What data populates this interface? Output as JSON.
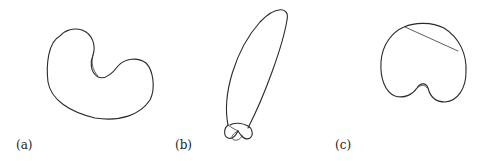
{
  "figure": {
    "panels": [
      {
        "id": "a",
        "label": "(a)",
        "shape": "kidney-shaped closed curve"
      },
      {
        "id": "b",
        "label": "(b)",
        "shape": "elongated ellipse with small overlapping loops at base"
      },
      {
        "id": "c",
        "label": "(c)",
        "shape": "rounded closed curve with chord across top and small notch at bottom"
      }
    ]
  },
  "colors": {
    "stroke": "#2a2a2a",
    "background": "#ffffff"
  }
}
